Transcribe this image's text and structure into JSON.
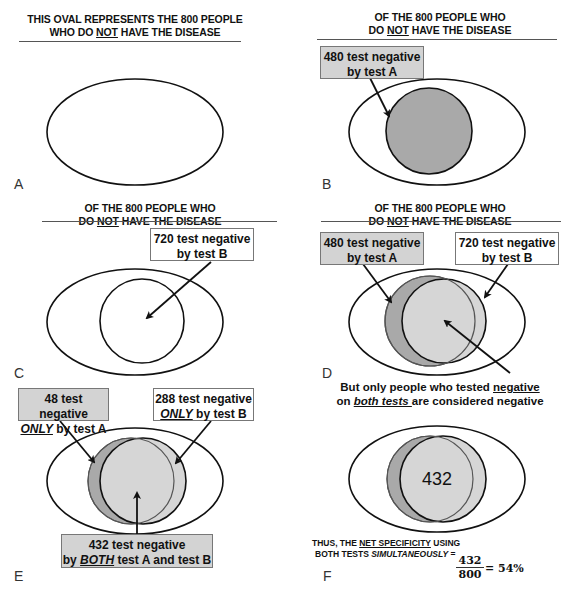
{
  "panels": {
    "A": {
      "letter": "A",
      "title_line1": "THIS OVAL REPRESENTS THE 800 PEOPLE",
      "title_line2_pre": "WHO DO ",
      "title_line2_u": "NOT",
      "title_line2_post": " HAVE THE DISEASE"
    },
    "B": {
      "letter": "B",
      "title_line1": "OF THE 800 PEOPLE WHO",
      "title_line2_pre": "DO ",
      "title_line2_u": "NOT",
      "title_line2_post": " HAVE THE DISEASE",
      "box_line1": "480 test negative",
      "box_line2": "by test A"
    },
    "C": {
      "letter": "C",
      "title_line1": "OF THE 800 PEOPLE WHO",
      "title_line2_pre": "DO ",
      "title_line2_u": "NOT",
      "title_line2_post": " HAVE THE DISEASE",
      "box_line1": "720 test negative",
      "box_line2": "by test B"
    },
    "D": {
      "letter": "D",
      "title_line1": "OF THE 800 PEOPLE WHO",
      "title_line2_pre": "DO ",
      "title_line2_u": "NOT",
      "title_line2_post": " HAVE THE DISEASE",
      "box_a_line1": "480 test negative",
      "box_a_line2": "by test A",
      "box_b_line1": "720 test negative",
      "box_b_line2": "by test B",
      "caption_line1_pre": "But only people who tested ",
      "caption_line1_u": "negative",
      "caption_line2_pre": "on ",
      "caption_line2_iu": "both tests ",
      "caption_line2_post": "are considered negative"
    },
    "E": {
      "letter": "E",
      "box_a_line1": "48 test negative",
      "box_a_line2_iu": "ONLY",
      "box_a_line2_post": " by test A",
      "box_b_line1": "288 test negative",
      "box_b_line2_iu": "ONLY",
      "box_b_line2_post": " by test B",
      "box_both_line1": "432 test negative",
      "box_both_line2_pre": "by ",
      "box_both_line2_iu": "BOTH",
      "box_both_line2_post": " test A and test B"
    },
    "F": {
      "letter": "F",
      "center_value": "432",
      "summary_line1_pre": "THUS, THE ",
      "summary_line1_u": "NET SPECIFICITY",
      "summary_line1_post": " USING",
      "summary_line2_pre": "BOTH TESTS ",
      "summary_line2_i": "SIMULTANEOUSLY",
      "summary_line2_post": " =",
      "fraction_numerator": "432",
      "fraction_denominator": "800",
      "result": "= 54%"
    }
  },
  "colors": {
    "test_a_fill": "#a9a9a9",
    "overlap_fill": "#d6d6d6",
    "box_grey": "#d3d3d3",
    "stroke": "#111111"
  }
}
